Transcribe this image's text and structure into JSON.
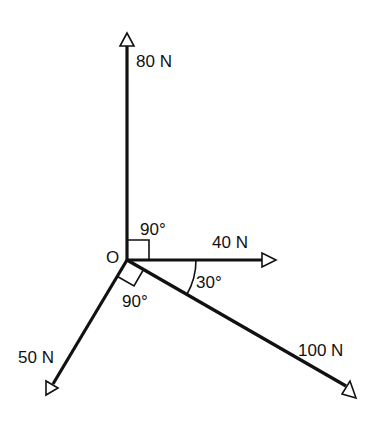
{
  "diagram": {
    "title": "",
    "origin_label": "O",
    "forces": [
      {
        "id": "f80",
        "label": "80 N",
        "direction": "up"
      },
      {
        "id": "f40",
        "label": "40 N",
        "direction": "right"
      },
      {
        "id": "f100",
        "label": "100 N",
        "direction": "down-right"
      },
      {
        "id": "f50",
        "label": "50 N",
        "direction": "down-left"
      }
    ],
    "angles": [
      {
        "id": "a1",
        "label": "90°",
        "between": "80 N and 40 N"
      },
      {
        "id": "a2",
        "label": "30°",
        "between": "40 N and 100 N"
      },
      {
        "id": "a3",
        "label": "90°",
        "between": "50 N and 100 N"
      }
    ]
  }
}
